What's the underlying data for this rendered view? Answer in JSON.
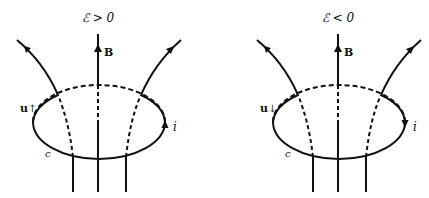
{
  "diagrams": [
    {
      "id": "left",
      "title": "ℰ > 0",
      "field_label": "B",
      "velocity_label": "u",
      "velocity_arrow": "↑",
      "current_label": "i",
      "current_direction": "up",
      "loop_label": "c"
    },
    {
      "id": "right",
      "title": "ℰ < 0",
      "field_label": "B",
      "velocity_label": "u",
      "velocity_arrow": "↓",
      "current_label": "i",
      "current_direction": "down",
      "loop_label": "c"
    }
  ],
  "colors": {
    "stroke": "#111111",
    "background": "#ffffff"
  }
}
